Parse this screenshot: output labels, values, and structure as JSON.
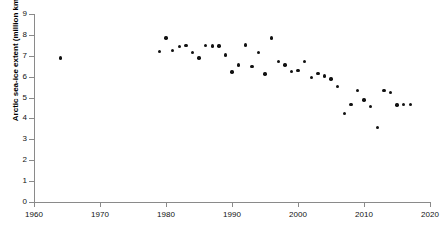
{
  "chart_data": {
    "type": "scatter",
    "title": "",
    "xlabel": "",
    "ylabel": "Arctic sea-ice extent (million km2)",
    "xlim": [
      1960,
      2020
    ],
    "ylim": [
      0,
      9
    ],
    "xticks": [
      1960,
      1970,
      1980,
      1990,
      2000,
      2010,
      2020
    ],
    "xtick_labels": [
      "1960",
      "1970",
      "1980",
      "1990",
      "2000",
      "2010",
      "2020"
    ],
    "yticks": [
      0,
      1,
      2,
      3,
      4,
      5,
      6,
      7,
      8,
      9
    ],
    "ytick_labels": [
      "0",
      "1",
      "2",
      "3",
      "4",
      "5",
      "6",
      "7",
      "8",
      "9"
    ],
    "grid": false,
    "legend": null,
    "marker": {
      "shape": "circle",
      "color": "#111111",
      "size": 3.4
    },
    "series": [
      {
        "name": "Arctic sea-ice extent",
        "x": [
          1964,
          1979,
          1980,
          1981,
          1982,
          1983,
          1984,
          1985,
          1986,
          1987,
          1988,
          1989,
          1990,
          1991,
          1992,
          1993,
          1994,
          1995,
          1996,
          1997,
          1998,
          1999,
          2000,
          2001,
          2002,
          2003,
          2004,
          2005,
          2006,
          2007,
          2008,
          2009,
          2010,
          2011,
          2012,
          2013,
          2014,
          2015,
          2016,
          2017
        ],
        "y": [
          6.9,
          7.2,
          7.85,
          7.25,
          7.45,
          7.5,
          7.15,
          6.9,
          7.5,
          7.47,
          7.47,
          7.03,
          6.22,
          6.55,
          7.52,
          6.48,
          7.15,
          6.12,
          7.85,
          6.73,
          6.56,
          6.24,
          6.3,
          6.72,
          5.95,
          6.14,
          6.04,
          5.89,
          5.53,
          4.25,
          4.68,
          5.34,
          4.89,
          4.58,
          3.57,
          5.33,
          5.24,
          4.65,
          4.67,
          4.67
        ]
      }
    ]
  },
  "axes": {
    "y_title": "Arctic sea-ice extent (million km2)"
  }
}
